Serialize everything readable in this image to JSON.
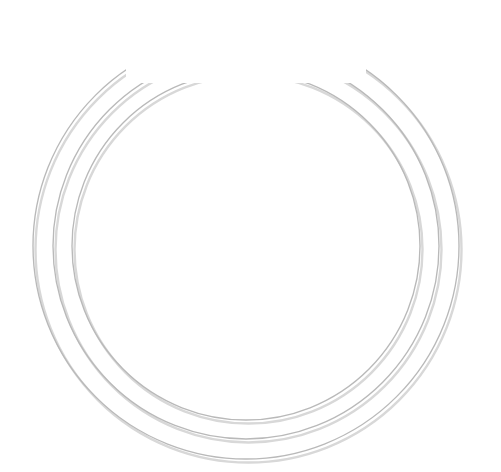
{
  "diagram": {
    "center": {
      "label": "BRAND",
      "color": "#0a0a0a",
      "text_color": "#ffffff",
      "radius": 43
    },
    "geometry": {
      "center_x": 246,
      "center_y": 246,
      "band_inner_radius": 148,
      "band_outer_radius": 165,
      "spoke_inner_radius": 56,
      "spoke_outer_radius": 148,
      "arrow_start_radius": 48,
      "arrow_end_radius": 82,
      "label_radius": 118,
      "spoke_count": 16,
      "arrow_count": 16
    },
    "outer_rings": [
      {
        "name": "changing-world",
        "label": "CHANGING WORLD",
        "radius": 213,
        "cx": 246,
        "cy": 246,
        "label_y": 33
      },
      {
        "name": "consumers",
        "label": "CONSUMERS",
        "radius": 193,
        "cx": 246,
        "cy": 246,
        "label_y": 53
      },
      {
        "name": "moment-situation",
        "label": "MOMENT / SITUATION",
        "radius": 174,
        "cx": 246,
        "cy": 246,
        "label_y": 74
      }
    ],
    "band_color": "#0a0a0a",
    "band_text_color": "#ffffff",
    "band_segments": [
      {
        "name": "home",
        "label": "HOME",
        "start_deg": -45,
        "end_deg": 0,
        "mid_deg": -22.5,
        "flip": false
      },
      {
        "name": "exterior",
        "label": "EXTERIOR",
        "start_deg": 0,
        "end_deg": 45,
        "mid_deg": 22.5,
        "flip": false
      },
      {
        "name": "store",
        "label": "STORE",
        "start_deg": 45,
        "end_deg": 90,
        "mid_deg": 67.5,
        "flip": false
      },
      {
        "name": "department",
        "label": "DEPARTMENT",
        "start_deg": 90,
        "end_deg": 135,
        "mid_deg": 112.5,
        "flip": true
      },
      {
        "name": "sub-departments",
        "label": "SUB-DEPARTMENTS",
        "start_deg": 135,
        "end_deg": 225,
        "mid_deg": 180,
        "flip": true
      },
      {
        "name": "product-brands",
        "label": "PRODUCT BRANDS",
        "start_deg": 225,
        "end_deg": 315,
        "mid_deg": 292.5,
        "flip": true
      }
    ],
    "spokes": [
      {
        "name": "price",
        "label": "price",
        "angle_deg": -78.75,
        "lines": [
          "price"
        ]
      },
      {
        "name": "service",
        "label": "service",
        "angle_deg": -56.25,
        "lines": [
          "service"
        ]
      },
      {
        "name": "personnel",
        "label": "personnel",
        "angle_deg": -33.75,
        "lines": [
          "personnel"
        ]
      },
      {
        "name": "internal-branding",
        "label": "internal branding",
        "angle_deg": -11.25,
        "lines": [
          "internal",
          "branding"
        ]
      },
      {
        "name": "online-activities",
        "label": "online activities",
        "angle_deg": 11.25,
        "lines": [
          "online",
          "activities"
        ]
      },
      {
        "name": "digital-integration",
        "label": "digital integration",
        "angle_deg": 33.75,
        "lines": [
          "digital",
          "integration"
        ]
      },
      {
        "name": "formats-channels",
        "label": "formats & channels",
        "angle_deg": 56.25,
        "lines": [
          "formats &",
          "channels"
        ]
      },
      {
        "name": "location",
        "label": "location",
        "angle_deg": 78.75,
        "lines": [
          "location"
        ]
      },
      {
        "name": "store-touchpoint",
        "label": "store",
        "angle_deg": 101.25,
        "lines": [
          "store"
        ]
      },
      {
        "name": "experience",
        "label": "experience",
        "angle_deg": 123.75,
        "lines": [
          "experience"
        ]
      },
      {
        "name": "mass-media-communications",
        "label": "mass media communications",
        "angle_deg": 146.25,
        "lines": [
          "mass media",
          "communications"
        ]
      },
      {
        "name": "in-store-communications",
        "label": "in-store communications",
        "angle_deg": 168.75,
        "lines": [
          "in-store",
          "communications"
        ]
      },
      {
        "name": "visual-merchandising",
        "label": "visual merchandising",
        "angle_deg": 191.25,
        "lines": [
          "visual",
          "merchandising"
        ]
      },
      {
        "name": "packaging",
        "label": "packaging",
        "angle_deg": 213.75,
        "lines": [
          "packaging"
        ]
      },
      {
        "name": "assortment",
        "label": "assortment",
        "angle_deg": 236.25,
        "lines": [
          "assortment"
        ]
      },
      {
        "name": "top-divider",
        "label": "",
        "angle_deg": 258.75,
        "lines": []
      }
    ],
    "colors": {
      "background": "#ffffff",
      "black": "#0a0a0a",
      "gray_ring": "#b9b9b9",
      "gray_ring_shadow": "#d8d8d8",
      "text_dark": "#2f2f2f",
      "hairline": "#b5b5b5"
    }
  }
}
